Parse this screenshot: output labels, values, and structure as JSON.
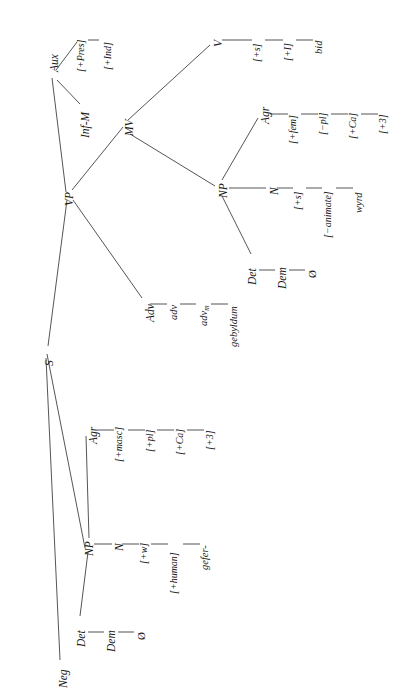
{
  "diagram": {
    "orientation": "rotated-90-ccw",
    "line_color": "#2a2a2a",
    "text_color": "#1a1a1a",
    "background": "#ffffff"
  },
  "nodes": {
    "s": "S",
    "neg": "Neg",
    "vp": "VP",
    "aux": "Aux",
    "aux_pres": "[+Pres]",
    "aux_ind": "[+Ind]",
    "inf_m": "Inf-M",
    "mv": "MV",
    "v": "V",
    "v_s": "[+s]",
    "v_i": "[+I]",
    "v_lex": "bid",
    "adv": "Adv",
    "adv_lower": "adv",
    "adv_m": "adv",
    "adv_m_sub": "m",
    "adv_lex": "gebyldum",
    "np_object": "NP",
    "np_object_det": "Det",
    "np_object_dem": "Dem",
    "np_object_zero": "Ø",
    "np_object_n": "N",
    "np_object_n_s": "[+s]",
    "np_object_n_animate": "[−animate]",
    "np_object_n_lex": "wyrd",
    "np_object_agr": "Agr",
    "np_object_agr_fem": "[+fem]",
    "np_object_agr_pl": "[−pl]",
    "np_object_agr_ca": "[+Ca]",
    "np_object_agr_3": "[+3]",
    "np_subject": "NP",
    "np_subject_det": "Det",
    "np_subject_dem": "Dem",
    "np_subject_zero": "Ø",
    "np_subject_n": "N",
    "np_subject_n_w": "[+w]",
    "np_subject_n_human": "[+human]",
    "np_subject_n_lex": "gefer-",
    "np_subject_agr": "Agr",
    "np_subject_agr_masc": "[+masc]",
    "np_subject_agr_pl": "[+pl]",
    "np_subject_agr_ca": "[+Ca]",
    "np_subject_agr_3": "[+3]"
  }
}
